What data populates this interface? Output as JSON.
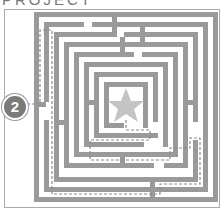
{
  "title": "PROJECT",
  "puzzle": {
    "type": "maze",
    "badge_number": "2",
    "goal_icon": "star-icon",
    "colors": {
      "walls": "#9a9a9a",
      "star": "#c4c4c4",
      "path": "#8a8a8a",
      "badge": "#7a7a7a",
      "frame": "#aaaaaa"
    }
  }
}
